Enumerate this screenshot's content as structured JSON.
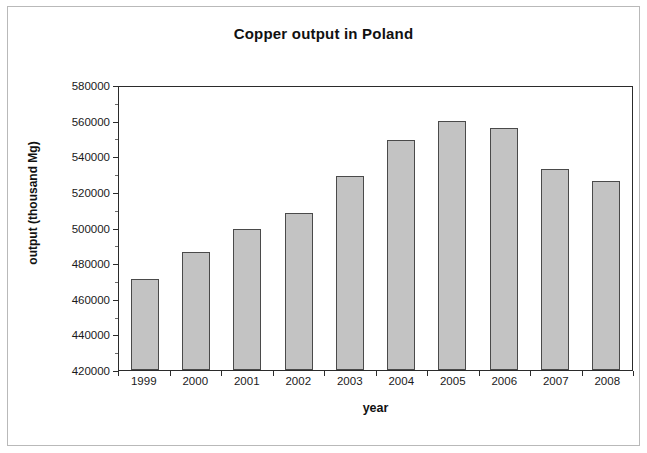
{
  "chart_data": {
    "type": "bar",
    "title": "Copper output in Poland",
    "xlabel": "year",
    "ylabel": "output (thousand Mg)",
    "categories": [
      "1999",
      "2000",
      "2001",
      "2002",
      "2003",
      "2004",
      "2005",
      "2006",
      "2007",
      "2008"
    ],
    "values": [
      471000,
      486000,
      499000,
      508000,
      529000,
      549000,
      560000,
      556000,
      533000,
      526000
    ],
    "ylim": [
      420000,
      580000
    ],
    "ytick_step": 20000,
    "yticks": [
      "580000",
      "560000",
      "540000",
      "520000",
      "500000",
      "480000",
      "460000",
      "440000",
      "420000"
    ],
    "ytick_values": [
      580000,
      560000,
      540000,
      520000,
      500000,
      480000,
      460000,
      440000,
      420000
    ],
    "grid": false,
    "legend": "none",
    "series": [
      {
        "name": "output",
        "values": [
          471000,
          486000,
          499000,
          508000,
          529000,
          549000,
          560000,
          556000,
          533000,
          526000
        ]
      }
    ],
    "colors": {
      "bar_fill": "#c3c3c3",
      "bar_border": "#4a4a4a",
      "axis": "#2b2b2b",
      "text": "#111111",
      "outer_frame": "#b9b9b9",
      "background": "#ffffff"
    }
  }
}
